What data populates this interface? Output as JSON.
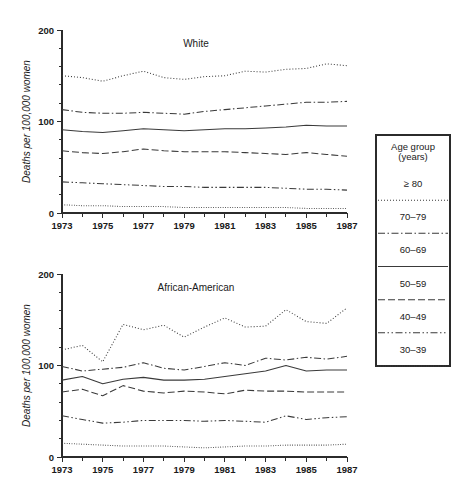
{
  "figure": {
    "width": 457,
    "height": 500,
    "background": "#ffffff",
    "ink_color": "#3a3a3a"
  },
  "legend": {
    "title_line1": "Age group",
    "title_line2": "(years)",
    "items": [
      {
        "label": "≥ 80",
        "dash": "1,2"
      },
      {
        "label": "70–79",
        "dash": "7,2.5,1.5,2.5"
      },
      {
        "label": "60–69",
        "dash": "none"
      },
      {
        "label": "50–59",
        "dash": "7,3"
      },
      {
        "label": "40–49",
        "dash": "7,2.5,1.5,2.5,1.5,2.5"
      },
      {
        "label": "30–39",
        "dash": "0.8,1.6"
      }
    ]
  },
  "chart_data": [
    {
      "type": "line",
      "title": "White",
      "xlabel": "",
      "ylabel": "Deaths per 100,000 women",
      "xlim": [
        1973,
        1987
      ],
      "ylim": [
        0,
        200
      ],
      "yticks": [
        0,
        100,
        200
      ],
      "yticks_minor": [
        20,
        40,
        60,
        80,
        120,
        140,
        160,
        180
      ],
      "xticks": [
        1973,
        1975,
        1977,
        1979,
        1981,
        1983,
        1985,
        1987
      ],
      "xticks_minor": [
        1974,
        1976,
        1978,
        1980,
        1982,
        1984,
        1986
      ],
      "grid": false,
      "legend_position": "right-external",
      "x": [
        1973,
        1974,
        1975,
        1976,
        1977,
        1978,
        1979,
        1980,
        1981,
        1982,
        1983,
        1984,
        1985,
        1986,
        1987
      ],
      "series": [
        {
          "name": "≥ 80",
          "dash": "1,2",
          "values": [
            150,
            148,
            144,
            150,
            155,
            148,
            146,
            149,
            150,
            155,
            154,
            157,
            158,
            163,
            161
          ]
        },
        {
          "name": "70–79",
          "dash": "7,2.5,1.5,2.5",
          "values": [
            113,
            110,
            109,
            109,
            110,
            109,
            108,
            111,
            113,
            115,
            117,
            119,
            121,
            121,
            122
          ]
        },
        {
          "name": "60–69",
          "dash": "none",
          "values": [
            91,
            89,
            88,
            90,
            92,
            91,
            90,
            91,
            92,
            92,
            93,
            94,
            96,
            95,
            95
          ]
        },
        {
          "name": "50–59",
          "dash": "7,3",
          "values": [
            68,
            66,
            65,
            67,
            70,
            68,
            67,
            67,
            67,
            66,
            65,
            64,
            66,
            64,
            62
          ]
        },
        {
          "name": "40–49",
          "dash": "7,2.5,1.5,2.5,1.5,2.5",
          "values": [
            34,
            33,
            32,
            31,
            30,
            29,
            29,
            28,
            28,
            28,
            28,
            27,
            26,
            26,
            25
          ]
        },
        {
          "name": "30–39",
          "dash": "0.8,1.6",
          "values": [
            9,
            8,
            8,
            7,
            7,
            7,
            6,
            6,
            6,
            6,
            6,
            6,
            5,
            5,
            5
          ]
        }
      ]
    },
    {
      "type": "line",
      "title": "African-American",
      "xlabel": "",
      "ylabel": "Deaths per 100,000 women",
      "xlim": [
        1973,
        1987
      ],
      "ylim": [
        0,
        200
      ],
      "yticks": [
        0,
        100,
        200
      ],
      "yticks_minor": [
        20,
        40,
        60,
        80,
        120,
        140,
        160,
        180
      ],
      "xticks": [
        1973,
        1975,
        1977,
        1979,
        1981,
        1983,
        1985,
        1987
      ],
      "xticks_minor": [
        1974,
        1976,
        1978,
        1980,
        1982,
        1984,
        1986
      ],
      "grid": false,
      "legend_position": "right-external",
      "x": [
        1973,
        1974,
        1975,
        1976,
        1977,
        1978,
        1979,
        1980,
        1981,
        1982,
        1983,
        1984,
        1985,
        1986,
        1987
      ],
      "series": [
        {
          "name": "≥ 80",
          "dash": "1,2",
          "values": [
            117,
            122,
            104,
            145,
            139,
            144,
            131,
            142,
            152,
            142,
            143,
            161,
            148,
            146,
            163
          ]
        },
        {
          "name": "70–79",
          "dash": "7,2.5,1.5,2.5",
          "values": [
            99,
            94,
            96,
            98,
            103,
            97,
            95,
            99,
            103,
            100,
            108,
            106,
            109,
            107,
            110
          ]
        },
        {
          "name": "60–69",
          "dash": "none",
          "values": [
            84,
            88,
            80,
            85,
            87,
            84,
            84,
            85,
            88,
            91,
            94,
            100,
            94,
            95,
            95
          ]
        },
        {
          "name": "50–59",
          "dash": "7,3",
          "values": [
            71,
            74,
            67,
            78,
            72,
            70,
            72,
            71,
            69,
            73,
            72,
            72,
            71,
            71,
            71
          ]
        },
        {
          "name": "40–49",
          "dash": "7,2.5,1.5,2.5,1.5,2.5",
          "values": [
            45,
            41,
            37,
            38,
            40,
            40,
            40,
            39,
            40,
            39,
            38,
            45,
            41,
            43,
            44
          ]
        },
        {
          "name": "30–39",
          "dash": "0.8,1.6",
          "values": [
            15,
            14,
            13,
            12,
            12,
            12,
            11,
            10,
            11,
            12,
            12,
            13,
            13,
            13,
            14
          ]
        }
      ]
    }
  ]
}
